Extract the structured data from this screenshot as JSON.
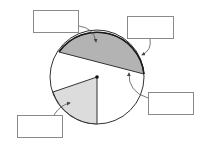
{
  "diagram": {
    "type": "circle-parts",
    "circle": {
      "cx": 97,
      "cy": 77,
      "r": 47
    },
    "colors": {
      "segment_fill": "#b3b3b3",
      "sector_fill": "#dcdcdc",
      "outline": "#333333",
      "arc_highlight": "#1a1a1a",
      "box_border": "#8a8a8a",
      "arrow": "#555555"
    },
    "labels": [
      {
        "id": "top-left",
        "text": ""
      },
      {
        "id": "top-right",
        "text": ""
      },
      {
        "id": "right",
        "text": ""
      },
      {
        "id": "bottom-left",
        "text": ""
      }
    ]
  }
}
